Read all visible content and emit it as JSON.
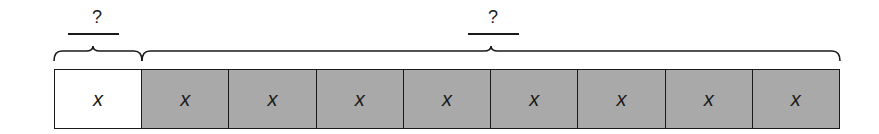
{
  "diagram": {
    "type": "tape-diagram",
    "bar": {
      "cells": [
        {
          "label": "x",
          "fill": "white"
        },
        {
          "label": "x",
          "fill": "gray"
        },
        {
          "label": "x",
          "fill": "gray"
        },
        {
          "label": "x",
          "fill": "gray"
        },
        {
          "label": "x",
          "fill": "gray"
        },
        {
          "label": "x",
          "fill": "gray"
        },
        {
          "label": "x",
          "fill": "gray"
        },
        {
          "label": "x",
          "fill": "gray"
        },
        {
          "label": "x",
          "fill": "gray"
        }
      ]
    },
    "braces": [
      {
        "label": "?",
        "spans_cells": "1",
        "position": "left"
      },
      {
        "label": "?",
        "spans_cells": "2-9",
        "position": "right"
      }
    ],
    "colors": {
      "white_cell": "#ffffff",
      "gray_cell": "#a9a9a9",
      "stroke": "#1a1a1a"
    }
  }
}
